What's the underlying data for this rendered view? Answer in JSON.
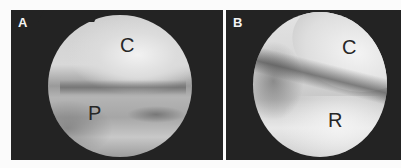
{
  "figure": {
    "panels": [
      {
        "id": "A",
        "label": "A",
        "annotations": [
          {
            "text": "C"
          },
          {
            "text": "P"
          }
        ]
      },
      {
        "id": "B",
        "label": "B",
        "annotations": [
          {
            "text": "C"
          },
          {
            "text": "R"
          }
        ]
      }
    ],
    "colors": {
      "panel_background": "#232323",
      "page_background": "#fbfbfb",
      "label_color": "#f4f4f4",
      "annotation_color": "#262626"
    }
  }
}
